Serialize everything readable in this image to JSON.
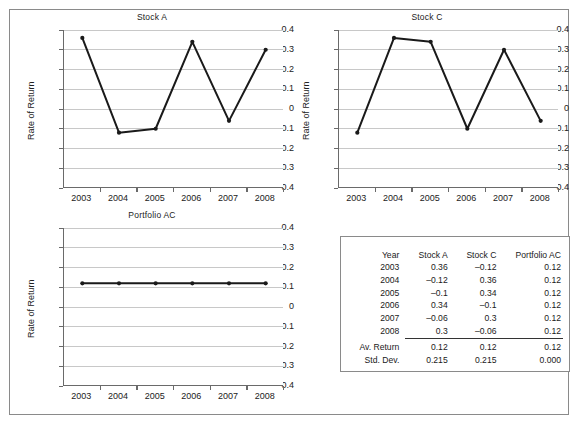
{
  "figure": {
    "frame_color": "#8a8a8a",
    "background": "#ffffff",
    "line_color": "#1a1a1a"
  },
  "axis": {
    "y_ticks": [
      "0.4",
      "0.3",
      "0.2",
      "0.1",
      "0",
      "-0.1",
      "-0.2",
      "-0.3",
      "-0.4"
    ],
    "x_ticks": [
      "2003",
      "2004",
      "2005",
      "2006",
      "2007",
      "2008"
    ],
    "y_label": "Rate of Return"
  },
  "charts": {
    "stock_a": {
      "title": "Stock A"
    },
    "stock_c": {
      "title": "Stock C"
    },
    "portfolio_ac": {
      "title": "Portfolio AC"
    }
  },
  "chart_data": [
    {
      "type": "line",
      "title": "Stock A",
      "xlabel": "",
      "ylabel": "Rate of Return",
      "x": [
        "2003",
        "2004",
        "2005",
        "2006",
        "2007",
        "2008"
      ],
      "categories": [
        "2003",
        "2004",
        "2005",
        "2006",
        "2007",
        "2008"
      ],
      "values": [
        0.36,
        -0.12,
        -0.1,
        0.34,
        -0.06,
        0.3
      ],
      "ylim": [
        -0.4,
        0.4
      ],
      "ytick_step": 0.1,
      "grid": true,
      "legend": false,
      "markers": true,
      "color": "#1a1a1a"
    },
    {
      "type": "line",
      "title": "Stock C",
      "xlabel": "",
      "ylabel": "Rate of Return",
      "x": [
        "2003",
        "2004",
        "2005",
        "2006",
        "2007",
        "2008"
      ],
      "categories": [
        "2003",
        "2004",
        "2005",
        "2006",
        "2007",
        "2008"
      ],
      "values": [
        -0.12,
        0.36,
        0.34,
        -0.1,
        0.3,
        -0.06
      ],
      "ylim": [
        -0.4,
        0.4
      ],
      "ytick_step": 0.1,
      "grid": true,
      "legend": false,
      "markers": true,
      "color": "#1a1a1a"
    },
    {
      "type": "line",
      "title": "Portfolio AC",
      "xlabel": "",
      "ylabel": "Rate of Return",
      "x": [
        "2003",
        "2004",
        "2005",
        "2006",
        "2007",
        "2008"
      ],
      "categories": [
        "2003",
        "2004",
        "2005",
        "2006",
        "2007",
        "2008"
      ],
      "values": [
        0.12,
        0.12,
        0.12,
        0.12,
        0.12,
        0.12
      ],
      "ylim": [
        -0.4,
        0.4
      ],
      "ytick_step": 0.1,
      "grid": true,
      "legend": false,
      "markers": true,
      "color": "#1a1a1a"
    }
  ],
  "table": {
    "headers": [
      "Year",
      "Stock A",
      "Stock C",
      "Portfolio AC"
    ],
    "rows": [
      [
        "2003",
        "0.36",
        "–0.12",
        "0.12"
      ],
      [
        "2004",
        "–0.12",
        "0.36",
        "0.12"
      ],
      [
        "2005",
        "–0.1",
        "0.34",
        "0.12"
      ],
      [
        "2006",
        "0.34",
        "–0.1",
        "0.12"
      ],
      [
        "2007",
        "–0.06",
        "0.3",
        "0.12"
      ],
      [
        "2008",
        "0.3",
        "–0.06",
        "0.12"
      ]
    ],
    "summary": [
      [
        "Av. Return",
        "0.12",
        "0.12",
        "0.12"
      ],
      [
        "Std. Dev.",
        "0.215",
        "0.215",
        "0.000"
      ]
    ]
  }
}
